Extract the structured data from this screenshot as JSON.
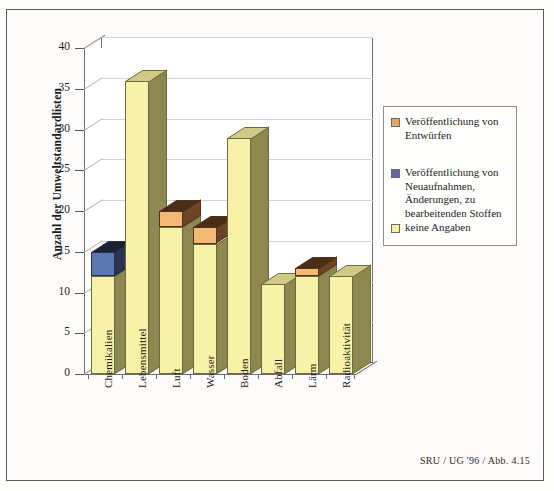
{
  "figure": {
    "source_caption": "SRU / UG '96 / Abb. 4.15"
  },
  "chart_data": {
    "type": "bar",
    "subtype": "stacked-3d-column",
    "title": "",
    "xlabel": "",
    "ylabel": "Anzahl der Umweltstandardlisten",
    "ylim": [
      0,
      40
    ],
    "ytick_step": 5,
    "yticks": [
      "40",
      "35",
      "30",
      "25",
      "20",
      "15",
      "10",
      "5",
      "0"
    ],
    "grid": true,
    "legend_position": "right",
    "categories": [
      "Chemikalien",
      "Lebensmittel",
      "Luft",
      "Wasser",
      "Boden",
      "Abfall",
      "Lärm",
      "Radioaktivität"
    ],
    "series": [
      {
        "name": "keine Angaben",
        "color": "#f6f0a4",
        "values": [
          12,
          36,
          18,
          16,
          29,
          11,
          12,
          12
        ]
      },
      {
        "name": "Veröffentlichung von Neuaufnahmen, Änderungen, zu bearbeitenden Stoffen",
        "color": "#6169a4",
        "values": [
          3,
          0,
          0,
          0,
          0,
          0,
          0,
          0
        ]
      },
      {
        "name": "Veröffentlichung von Entwürfen",
        "color": "#e8a664",
        "values": [
          0,
          0,
          2,
          2,
          0,
          0,
          1,
          0
        ]
      }
    ],
    "totals": [
      15,
      36,
      20,
      18,
      29,
      11,
      13,
      12
    ],
    "legend": [
      {
        "label": "Veröffentlichung von Entwürfen",
        "color": "#e8a664"
      },
      {
        "label": "Veröffentlichung von Neuaufnahmen, Änderungen, zu bearbeitenden Stoffen",
        "color": "#6169a4"
      },
      {
        "label": "keine Angaben",
        "color": "#f6f0a4"
      }
    ]
  }
}
